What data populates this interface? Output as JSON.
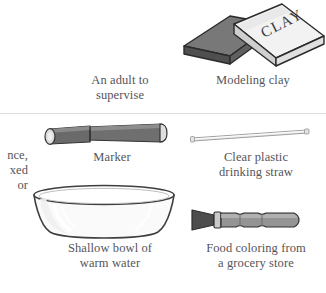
{
  "page": {
    "background_color": "#ffffff",
    "text_color": "#55555a",
    "divider_color": "#dcdcdc",
    "width": 326,
    "height": 293
  },
  "clipped_text": {
    "line1": "nce,",
    "line2": "xed",
    "line3": "or"
  },
  "items": [
    {
      "id": "adult-supervise",
      "caption": "An adult to\nsupervise",
      "icon": "adult-supervisor-placeholder"
    },
    {
      "id": "modeling-clay",
      "caption": "Modeling clay",
      "icon": "clay-box-icon",
      "label_on_object": "CLAY",
      "colors": {
        "block": "#575757",
        "block_top": "#6e6e6e",
        "wrapper": "#efefef",
        "wrapper_side": "#bdbdbd",
        "outline": "#2b2b2b"
      }
    },
    {
      "id": "marker",
      "caption": "Marker",
      "icon": "marker-icon",
      "colors": {
        "body": "#6b6b6b",
        "body_light": "#8a8a8a",
        "cap_end": "#dddddd",
        "outline": "#3a3a3a"
      }
    },
    {
      "id": "drinking-straw",
      "caption": "Clear plastic\ndrinking straw",
      "icon": "straw-icon",
      "colors": {
        "body": "#e8e8e8",
        "outline": "#8f8f8f"
      }
    },
    {
      "id": "bowl-warm-water",
      "caption": "Shallow bowl of\nwarm water",
      "icon": "bowl-icon",
      "colors": {
        "glass": "#fbfbfb",
        "rim": "#efefef",
        "outline": "#4a4a4a",
        "highlight": "#ffffff"
      }
    },
    {
      "id": "food-coloring",
      "caption": "Food coloring from\na grocery store",
      "icon": "food-coloring-bottle-icon",
      "colors": {
        "body": "#8d8d8d",
        "body_light": "#a6a6a6",
        "tip": "#4a4a4a",
        "outline": "#333333"
      }
    }
  ]
}
